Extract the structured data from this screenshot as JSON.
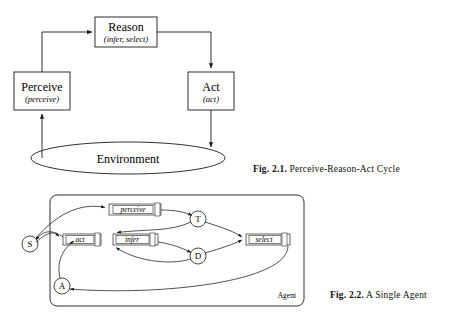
{
  "figure1": {
    "caption_number": "Fig. 2.1.",
    "caption_text": "Perceive-Reason-Act Cycle",
    "nodes": {
      "reason": {
        "title": "Reason",
        "subtitle": "(infer, select)"
      },
      "perceive": {
        "title": "Perceive",
        "subtitle": "(perceive)"
      },
      "act": {
        "title": "Act",
        "subtitle": "(act)"
      },
      "environment": {
        "title": "Environment"
      }
    },
    "edges": [
      {
        "from": "perceive",
        "to": "reason"
      },
      {
        "from": "reason",
        "to": "act"
      },
      {
        "from": "act",
        "to": "environment"
      },
      {
        "from": "environment",
        "to": "perceive"
      }
    ]
  },
  "figure2": {
    "caption_number": "Fig. 2.2.",
    "caption_text": "A Single Agent",
    "container_label": "Agent",
    "modules": [
      {
        "id": "perceive",
        "label": "perceive"
      },
      {
        "id": "act",
        "label": "act"
      },
      {
        "id": "infer",
        "label": "infer"
      },
      {
        "id": "select",
        "label": "select"
      }
    ],
    "nodes": [
      {
        "id": "S",
        "label": "S"
      },
      {
        "id": "T",
        "label": "T"
      },
      {
        "id": "D",
        "label": "D"
      },
      {
        "id": "A",
        "label": "A"
      }
    ],
    "edges": [
      {
        "from": "S",
        "to": "perceive"
      },
      {
        "from": "perceive",
        "to": "T"
      },
      {
        "from": "T",
        "to": "infer"
      },
      {
        "from": "infer",
        "to": "D"
      },
      {
        "from": "D",
        "to": "infer"
      },
      {
        "from": "T",
        "to": "select"
      },
      {
        "from": "D",
        "to": "select"
      },
      {
        "from": "select",
        "to": "A"
      },
      {
        "from": "A",
        "to": "act"
      },
      {
        "from": "act",
        "to": "S"
      }
    ]
  },
  "colors": {
    "ink": "#1a1a1a",
    "paper": "#ffffff",
    "module_fill": "#fbfbfb"
  }
}
